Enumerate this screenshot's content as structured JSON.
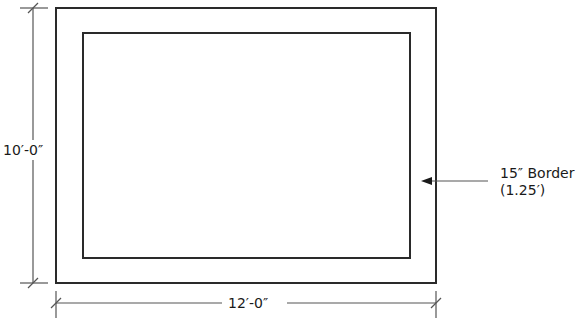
{
  "diagram": {
    "type": "floor-plan-dimension",
    "outer_rect": {
      "x": 56,
      "y": 8,
      "w": 380,
      "h": 275
    },
    "inner_rect": {
      "x": 83,
      "y": 33,
      "w": 327,
      "h": 225
    },
    "height_label": "10′-0″",
    "width_label": "12′-0″",
    "border_label_line1": "15″ Border",
    "border_label_line2": "(1.25′)",
    "colors": {
      "stroke": "#2a2a2a",
      "dim": "#555555",
      "text": "#1a1a1a"
    }
  }
}
